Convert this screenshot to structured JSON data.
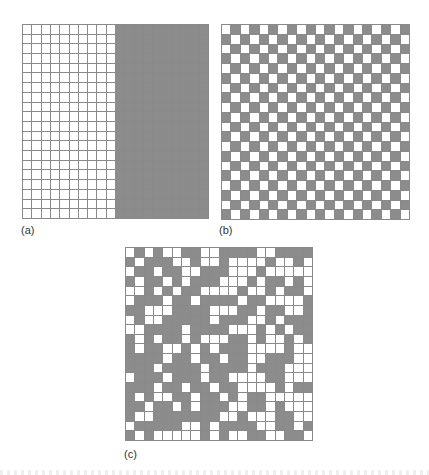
{
  "figure": {
    "panels": [
      {
        "id": "a",
        "label": "(a)",
        "description": "Left half white, right half gray (segregated)",
        "rows": 20,
        "cols": 20,
        "pattern": [
          "00000000001111111111",
          "00000000001111111111",
          "00000000001111111111",
          "00000000001111111111",
          "00000000001111111111",
          "00000000001111111111",
          "00000000001111111111",
          "00000000001111111111",
          "00000000001111111111",
          "00000000001111111111",
          "00000000001111111111",
          "00000000001111111111",
          "00000000001111111111",
          "00000000001111111111",
          "00000000001111111111",
          "00000000001111111111",
          "00000000001111111111",
          "00000000001111111111",
          "00000000001111111111",
          "00000000001111111111"
        ]
      },
      {
        "id": "b",
        "label": "(b)",
        "description": "Checkerboard alternating pattern",
        "rows": 20,
        "cols": 20,
        "pattern": [
          "01010101010101010101",
          "10101010101010101010",
          "01010101010101010101",
          "10101010101010101010",
          "01010101010101010101",
          "10101010101010101010",
          "01010101010101010101",
          "10101010101010101010",
          "01010101010101010101",
          "10101010101010101010",
          "01010101010101010101",
          "10101010101010101010",
          "01010101010101010101",
          "10101010101010101010",
          "01010101010101010101",
          "10101010101010101010",
          "01010101010101010101",
          "10101010101010101010",
          "01010101010101010101",
          "10101010101010101010"
        ]
      },
      {
        "id": "c",
        "label": "(c)",
        "description": "Random pattern",
        "rows": 20,
        "cols": 20,
        "pattern": [
          "01010011001111001111",
          "10111001001000010010",
          "01101100111000100000",
          "10110101110001011010",
          "00101011000010010110",
          "01110110111101100001",
          "11000111100011011001",
          "01001111101110010111",
          "00111101111000101011",
          "10101101000110100101",
          "10110010101110000100",
          "11110110110110011100",
          "11101111011110111000",
          "01110111011000011000",
          "11101101101100001011",
          "10100110110101100000",
          "11011010111001101000",
          "10011111110010001100",
          "01111100101111001101",
          "10100000101001100110"
        ]
      }
    ],
    "colors": {
      "filled": "#8c8c8c",
      "empty": "#ffffff",
      "gridline": "#8a8a8a"
    }
  }
}
